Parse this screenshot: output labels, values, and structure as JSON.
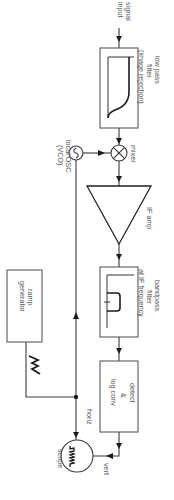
{
  "diagram": {
    "type": "block-diagram",
    "orientation": "rotated-90-clockwise",
    "colors": {
      "line": "#3a3a3a",
      "text": "#555555",
      "background": "#ffffff"
    },
    "labels": {
      "signal_input": [
        "signal",
        "input"
      ],
      "low_pass_filter": [
        "low pass",
        "filter",
        "(image rejection)"
      ],
      "mixer": "mixer",
      "local_osc": [
        "local OSC",
        "(VCO)"
      ],
      "if_amp": "IF amp",
      "bandpass_filter": [
        "bandpass",
        "filter",
        "at IF frequency"
      ],
      "ramp_generator": [
        "ramp",
        "generator"
      ],
      "detect_log": [
        "detect",
        "&",
        "log conv"
      ],
      "horiz": "horiz",
      "vert": "vert",
      "scope": "scope"
    },
    "blocks": [
      {
        "id": "lpf",
        "name": "low pass filter (image rejection)",
        "icon": "lowpass-response-icon"
      },
      {
        "id": "mixer",
        "name": "mixer",
        "icon": "mixer-x-circle-icon"
      },
      {
        "id": "osc",
        "name": "local OSC (VCO)",
        "icon": "sine-oscillator-icon"
      },
      {
        "id": "ifamp",
        "name": "IF amp",
        "icon": "amplifier-triangle-icon"
      },
      {
        "id": "bpf",
        "name": "bandpass filter at IF frequency",
        "icon": "bandpass-response-icon"
      },
      {
        "id": "detect",
        "name": "detect & log conv"
      },
      {
        "id": "ramp",
        "name": "ramp generator",
        "icon": "sawtooth-icon"
      },
      {
        "id": "scope",
        "name": "scope",
        "icon": "spectrum-display-icon"
      }
    ],
    "connections": [
      {
        "from": "signal input",
        "to": "lpf"
      },
      {
        "from": "lpf",
        "to": "mixer"
      },
      {
        "from": "osc",
        "to": "mixer"
      },
      {
        "from": "mixer",
        "to": "ifamp"
      },
      {
        "from": "ifamp",
        "to": "bpf"
      },
      {
        "from": "bpf",
        "to": "detect"
      },
      {
        "from": "detect",
        "to": "scope",
        "label": "vert"
      },
      {
        "from": "ramp",
        "to": "scope",
        "label": "horiz"
      },
      {
        "from": "ramp",
        "to": "osc"
      }
    ]
  }
}
